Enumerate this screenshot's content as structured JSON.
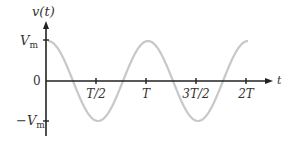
{
  "chart_data": {
    "type": "line",
    "title": "",
    "xlabel": "t",
    "ylabel": "v(t)",
    "x_ticks": [
      "T/2",
      "T",
      "3T/2",
      "2T"
    ],
    "x_tick_values": [
      0.5,
      1.0,
      1.5,
      2.0
    ],
    "y_ticks": [
      "Vm",
      "0",
      "−Vm"
    ],
    "y_tick_values": [
      1,
      0,
      -1
    ],
    "xlim": [
      0,
      2.0
    ],
    "ylim": [
      -1,
      1
    ],
    "grid": false,
    "legend": null,
    "series": [
      {
        "name": "v(t) = Vm cos(2πt/T)",
        "function": "cosine",
        "amplitude": "Vm",
        "period": "T",
        "x": [
          0,
          0.25,
          0.5,
          0.75,
          1.0,
          1.25,
          1.5,
          1.75,
          2.0
        ],
        "values": [
          1,
          0,
          -1,
          0,
          1,
          0,
          -1,
          0,
          1
        ],
        "color": "#c8c8c8"
      }
    ]
  },
  "labels": {
    "y_axis": "v(t)",
    "x_axis": "t",
    "vm_main": "V",
    "vm_sub": "m",
    "neg_vm_main": "−V",
    "neg_vm_sub": "m",
    "zero": "0",
    "tick_half": "T/2",
    "tick_T": "T",
    "tick_3half": "3T/2",
    "tick_2T": "2T"
  },
  "colors": {
    "axis": "#222222",
    "curve": "#c8c8c8",
    "text": "#333333"
  }
}
